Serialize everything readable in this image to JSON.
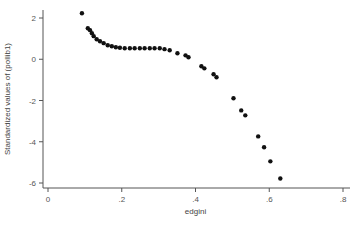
{
  "chart_data": {
    "type": "scatter",
    "title": "",
    "xlabel": "edgini",
    "ylabel": "Standardized values of (pollib1)",
    "xlim": [
      0,
      0.8
    ],
    "ylim": [
      -6,
      2
    ],
    "xticks": [
      0,
      0.2,
      0.4,
      0.6,
      0.8
    ],
    "xtick_labels": [
      "0",
      ".2",
      ".4",
      ".6",
      ".8"
    ],
    "yticks": [
      -6,
      -4,
      -2,
      0,
      2
    ],
    "ytick_labels": [
      "-6",
      "-4",
      "-2",
      "0",
      "2"
    ],
    "grid": false,
    "legend": "none",
    "points": [
      {
        "x": 0.092,
        "y": 2.23
      },
      {
        "x": 0.108,
        "y": 1.5
      },
      {
        "x": 0.114,
        "y": 1.41
      },
      {
        "x": 0.119,
        "y": 1.26
      },
      {
        "x": 0.124,
        "y": 1.12
      },
      {
        "x": 0.132,
        "y": 0.97
      },
      {
        "x": 0.141,
        "y": 0.87
      },
      {
        "x": 0.151,
        "y": 0.78
      },
      {
        "x": 0.162,
        "y": 0.68
      },
      {
        "x": 0.173,
        "y": 0.63
      },
      {
        "x": 0.184,
        "y": 0.58
      },
      {
        "x": 0.195,
        "y": 0.56
      },
      {
        "x": 0.208,
        "y": 0.53
      },
      {
        "x": 0.222,
        "y": 0.53
      },
      {
        "x": 0.235,
        "y": 0.53
      },
      {
        "x": 0.249,
        "y": 0.53
      },
      {
        "x": 0.262,
        "y": 0.53
      },
      {
        "x": 0.276,
        "y": 0.53
      },
      {
        "x": 0.289,
        "y": 0.53
      },
      {
        "x": 0.303,
        "y": 0.53
      },
      {
        "x": 0.316,
        "y": 0.49
      },
      {
        "x": 0.33,
        "y": 0.44
      },
      {
        "x": 0.351,
        "y": 0.29
      },
      {
        "x": 0.373,
        "y": 0.19
      },
      {
        "x": 0.381,
        "y": 0.1
      },
      {
        "x": 0.416,
        "y": -0.34
      },
      {
        "x": 0.424,
        "y": -0.44
      },
      {
        "x": 0.449,
        "y": -0.73
      },
      {
        "x": 0.457,
        "y": -0.87
      },
      {
        "x": 0.503,
        "y": -1.89
      },
      {
        "x": 0.524,
        "y": -2.48
      },
      {
        "x": 0.535,
        "y": -2.72
      },
      {
        "x": 0.57,
        "y": -3.74
      },
      {
        "x": 0.586,
        "y": -4.27
      },
      {
        "x": 0.603,
        "y": -4.95
      },
      {
        "x": 0.63,
        "y": -5.78
      }
    ]
  }
}
